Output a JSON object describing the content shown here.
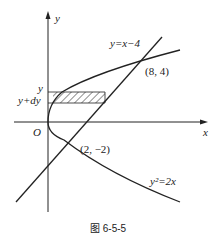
{
  "figure": {
    "caption": "图 6-5-5",
    "axes": {
      "x_label": "x",
      "y_label": "y",
      "origin_label": "O"
    },
    "curves": {
      "line_label": "y=x−4",
      "parabola_label": "y²=2x"
    },
    "points": {
      "upper_intersection": "(8, 4)",
      "lower_intersection": "(2, −2)"
    },
    "strip": {
      "top_label": "y",
      "bottom_label": "y+dy"
    }
  },
  "colors": {
    "stroke": "#222222",
    "background": "#ffffff"
  }
}
